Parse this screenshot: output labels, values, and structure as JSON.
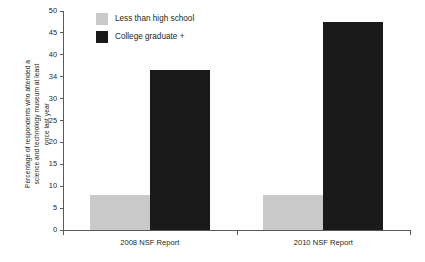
{
  "chart_data": {
    "type": "bar",
    "title": "",
    "xlabel": "",
    "ylabel": "Percentage of respondents who attended a science and technology museum at least once last year",
    "ylabel_lines": [
      "Percentage of respondents who attended a",
      "science and technology museum at least",
      "once last year"
    ],
    "categories": [
      "2008 NSF Report",
      "2010 NSF Report"
    ],
    "series": [
      {
        "name": "Less than high school",
        "color": "#c9c9c9",
        "values": [
          8,
          8
        ]
      },
      {
        "name": "College graduate +",
        "color": "#1a1a1a",
        "values": [
          36.5,
          47.5
        ]
      }
    ],
    "ylim": [
      0,
      50
    ],
    "yticks": [
      0,
      5,
      10,
      15,
      20,
      25,
      30,
      34,
      40,
      45,
      50
    ],
    "ytick_labels": [
      "0",
      "5",
      "10",
      "15",
      "20",
      "25",
      "30",
      "34",
      "40",
      "45",
      "50"
    ],
    "ytick_positions": [
      0,
      5,
      10,
      15,
      20,
      25,
      30,
      35,
      40,
      45,
      50
    ],
    "grid": false,
    "legend_position": "top-center"
  },
  "legend": {
    "items": [
      {
        "label": "Less than high school",
        "color": "#c9c9c9"
      },
      {
        "label": "College graduate +",
        "color": "#1a1a1a"
      }
    ]
  },
  "axes": {
    "x_categories": [
      "2008 NSF Report",
      "2010 NSF Report"
    ],
    "y_labels": [
      "50",
      "45",
      "40",
      "34",
      "30",
      "25",
      "20",
      "15",
      "10",
      "5",
      "0"
    ]
  }
}
